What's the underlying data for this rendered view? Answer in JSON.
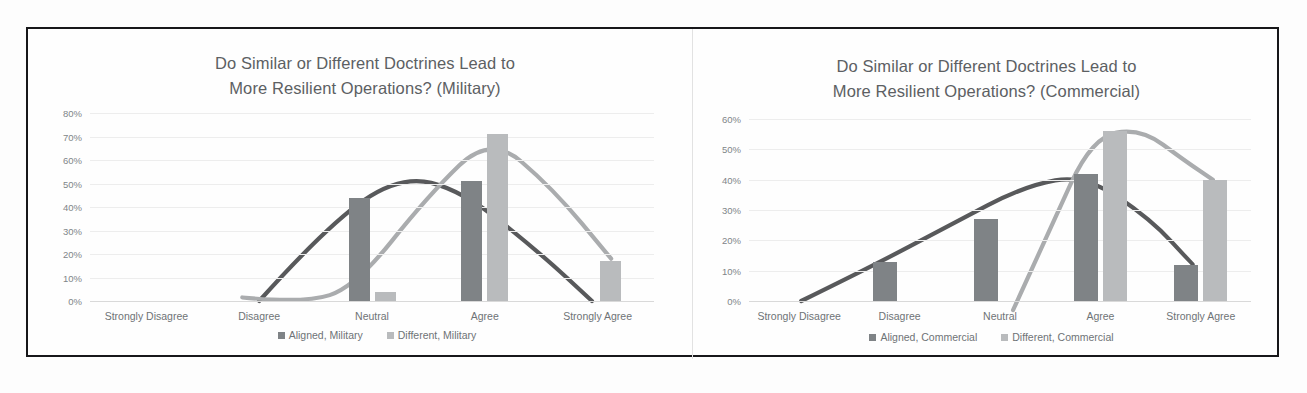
{
  "figure": {
    "border_color": "#17171a",
    "background": "#fefefe"
  },
  "colors": {
    "aligned_bar": "#7f8386",
    "different_bar": "#b9bbbd",
    "aligned_curve": "#58595b",
    "different_curve": "#aaacae",
    "gridline": "#ededed",
    "text": "#6e7376",
    "title_text": "#5c6063"
  },
  "chart_data": [
    {
      "id": "military",
      "type": "bar",
      "title": "Do Similar or Different Doctrines Lead to More Resilient Operations? (Military)",
      "title_lines": [
        "Do Similar or Different Doctrines Lead to",
        "More Resilient Operations? (Military)"
      ],
      "xlabel": "",
      "ylabel": "",
      "ylim": [
        0,
        80
      ],
      "yticks": [
        0,
        10,
        20,
        30,
        40,
        50,
        60,
        70,
        80
      ],
      "ytick_labels": [
        "0%",
        "10%",
        "20%",
        "30%",
        "40%",
        "50%",
        "60%",
        "70%",
        "80%"
      ],
      "grid": true,
      "legend_position": "bottom",
      "categories": [
        "Strongly Disagree",
        "Disagree",
        "Neutral",
        "Agree",
        "Strongly Agree"
      ],
      "series": [
        {
          "name": "Aligned, Military",
          "values": [
            0,
            0,
            44,
            51,
            0
          ]
        },
        {
          "name": "Different, Military",
          "values": [
            0,
            0,
            4,
            71,
            17
          ]
        }
      ],
      "trendlines": [
        {
          "name": "Aligned, Military trend",
          "peak_category": "Neutral-Agree",
          "peak_value": 54
        },
        {
          "name": "Different, Military trend",
          "peak_category": "Agree",
          "peak_value": 71
        }
      ]
    },
    {
      "id": "commercial",
      "type": "bar",
      "title": "Do Similar or Different Doctrines Lead to More Resilient Operations? (Commercial)",
      "title_lines": [
        "Do Similar or Different Doctrines Lead to",
        "More Resilient Operations? (Commercial)"
      ],
      "xlabel": "",
      "ylabel": "",
      "ylim": [
        0,
        60
      ],
      "yticks": [
        0,
        10,
        20,
        30,
        40,
        50,
        60
      ],
      "ytick_labels": [
        "0%",
        "10%",
        "20%",
        "30%",
        "40%",
        "50%",
        "60%"
      ],
      "grid": true,
      "legend_position": "bottom",
      "categories": [
        "Strongly Disagree",
        "Disagree",
        "Neutral",
        "Agree",
        "Strongly Agree"
      ],
      "series": [
        {
          "name": "Aligned, Commercial",
          "values": [
            0,
            13,
            27,
            42,
            12
          ]
        },
        {
          "name": "Different, Commercial",
          "values": [
            0,
            0,
            0,
            56,
            40
          ]
        }
      ],
      "trendlines": [
        {
          "name": "Aligned, Commercial trend",
          "peak_category": "Agree",
          "peak_value": 42
        },
        {
          "name": "Different, Commercial trend",
          "peak_category": "Agree",
          "peak_value": 57
        }
      ]
    }
  ]
}
